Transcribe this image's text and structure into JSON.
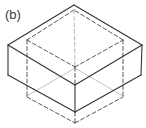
{
  "figure": {
    "label": "(b)",
    "colors": {
      "solid_line": "#333333",
      "dashed_line": "#444444",
      "hidden_line": "#9a9a9a",
      "background": "#ffffff"
    },
    "outer_box": {
      "style": "solid",
      "top_face": [
        [
          74,
          5
        ],
        [
          8,
          45
        ],
        [
          75,
          85
        ],
        [
          142,
          45
        ]
      ],
      "verticals": [
        [
          [
            8,
            45
          ],
          [
            8,
            75
          ]
        ],
        [
          [
            75,
            85
          ],
          [
            75,
            112
          ]
        ],
        [
          [
            142,
            45
          ],
          [
            141,
            75
          ]
        ]
      ],
      "bottom_edges": [
        [
          [
            8,
            75
          ],
          [
            75,
            112
          ]
        ],
        [
          [
            75,
            112
          ],
          [
            141,
            75
          ]
        ]
      ]
    },
    "inner_box": {
      "style": "dashed",
      "top_face": [
        [
          74,
          10
        ],
        [
          27,
          40
        ],
        [
          75,
          67
        ],
        [
          123,
          40
        ]
      ],
      "verticals": [
        [
          [
            27,
            40
          ],
          [
            27,
            97
          ]
        ],
        [
          [
            123,
            40
          ],
          [
            123,
            97
          ]
        ],
        [
          [
            75,
            67
          ],
          [
            75,
            85
          ]
        ],
        [
          [
            75,
            112
          ],
          [
            75,
            123
          ]
        ]
      ],
      "bottom_edges": [
        [
          [
            27,
            97
          ],
          [
            75,
            123
          ]
        ],
        [
          [
            75,
            123
          ],
          [
            123,
            97
          ]
        ]
      ],
      "back_vertical": [
        [
          74,
          10
        ],
        [
          75,
          67
        ]
      ]
    },
    "hidden_lines": [
      [
        [
          75,
          68
        ],
        [
          27,
          96
        ]
      ],
      [
        [
          75,
          68
        ],
        [
          123,
          96
        ]
      ]
    ]
  }
}
